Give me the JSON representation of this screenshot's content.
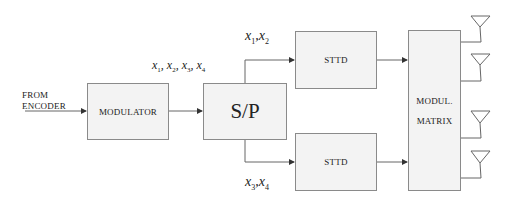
{
  "diagram": {
    "input_label_line1": "FROM",
    "input_label_line2": "ENCODER",
    "modulator": {
      "label": "MODULATOR"
    },
    "sp": {
      "label": "S/P"
    },
    "symbols_all": {
      "x": "x",
      "subs": [
        "1",
        "2",
        "3",
        "4"
      ]
    },
    "symbols_top": {
      "x": "x",
      "subs": [
        "1",
        "2"
      ]
    },
    "symbols_bottom": {
      "x": "x",
      "subs": [
        "3",
        "4"
      ]
    },
    "sttd_top": {
      "label": "STTD"
    },
    "sttd_bottom": {
      "label": "STTD"
    },
    "matrix": {
      "line1": "MODUL.",
      "line2": "MATRIX"
    },
    "antenna_count": 4,
    "colors": {
      "box_fill": "#f3f3f3",
      "box_border": "#8a8a8a",
      "line": "#555555"
    }
  }
}
